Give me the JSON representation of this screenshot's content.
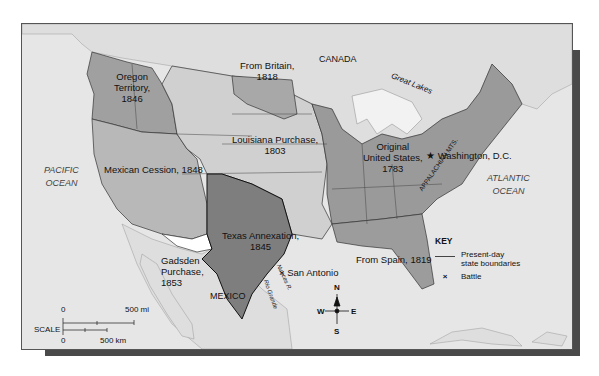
{
  "map": {
    "title": "Territorial Expansion of the United States",
    "regions": [
      {
        "id": "original",
        "label": "Original United States, 1783",
        "lines": [
          "Original",
          "United States,",
          "1783"
        ],
        "color": "#9a9a9a"
      },
      {
        "id": "louisiana",
        "label": "Louisiana Purchase, 1803",
        "lines": [
          "Louisiana Purchase,",
          "1803"
        ],
        "color": "#d0d0d0"
      },
      {
        "id": "britain",
        "label": "From Britain, 1818",
        "lines": [
          "From Britain,",
          "1818"
        ],
        "color": "#a8a8a8"
      },
      {
        "id": "spain",
        "label": "From Spain, 1819",
        "lines": [
          "From Spain, 1819"
        ],
        "color": "#9c9c9c"
      },
      {
        "id": "texas",
        "label": "Texas Annexation, 1845",
        "lines": [
          "Texas Annexation,",
          "1845"
        ],
        "color": "#7e7e7e"
      },
      {
        "id": "oregon",
        "label": "Oregon Territory, 1846",
        "lines": [
          "Oregon",
          "Territory,",
          "1846"
        ],
        "color": "#a0a0a0"
      },
      {
        "id": "mexican",
        "label": "Mexican Cession, 1848",
        "lines": [
          "Mexican Cession, 1848"
        ],
        "color": "#b8b8b8"
      },
      {
        "id": "gadsden",
        "label": "Gadsden Purchase, 1853",
        "lines": [
          "Gadsden",
          "Purchase,",
          "1853"
        ],
        "color": "#ffffff"
      }
    ],
    "places": {
      "canada": "CANADA",
      "mexico": "MEXICO",
      "pacific": [
        "PACIFIC",
        "OCEAN"
      ],
      "atlantic": [
        "ATLANTIC",
        "OCEAN"
      ],
      "great_lakes": "Great Lakes",
      "washington": "Washington, D.C.",
      "san_antonio": "San Antonio",
      "appalachian": "APPALACHIAN MTS.",
      "rio_grande": "Rio Grande",
      "nueces": "Nueces R."
    },
    "key": {
      "title": "KEY",
      "items": [
        {
          "symbol": "line",
          "label": [
            "Present-day",
            "state boundaries"
          ]
        },
        {
          "symbol": "×",
          "label": [
            "Battle"
          ]
        }
      ]
    },
    "scale": {
      "label": "SCALE",
      "mi_zero": "0",
      "mi_max": "500 mi",
      "km_zero": "0",
      "km_max": "500 km"
    },
    "compass": {
      "n": "N",
      "s": "S",
      "e": "E",
      "w": "W"
    },
    "colors": {
      "water": "#e6e6e6",
      "foreign_land": "#dcdcdc",
      "lakes": "#f2f2f2",
      "frame_border": "#555555",
      "shadow": "#4a4a4a"
    }
  }
}
